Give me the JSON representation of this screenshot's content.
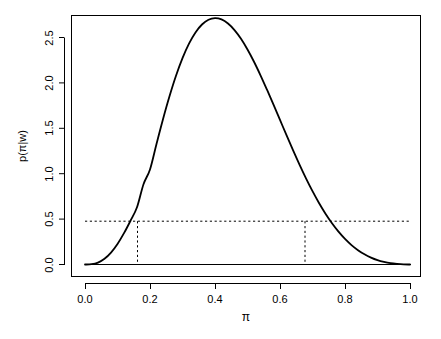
{
  "chart_data": {
    "type": "line",
    "title": "",
    "subtitle": "",
    "xlabel": "π",
    "ylabel": "p(π|w)",
    "xlim": [
      0.0,
      1.0
    ],
    "ylim": [
      0.0,
      2.75
    ],
    "grid": false,
    "legend": null,
    "x_ticks": [
      "0.0",
      "0.2",
      "0.4",
      "0.6",
      "0.8",
      "1.0"
    ],
    "x_tick_values": [
      0.0,
      0.2,
      0.4,
      0.6,
      0.8,
      1.0
    ],
    "y_ticks": [
      "0.0",
      "0.5",
      "1.0",
      "1.5",
      "2.0",
      "2.5"
    ],
    "y_tick_values": [
      0.0,
      0.5,
      1.0,
      1.5,
      2.0,
      2.5
    ],
    "series": [
      {
        "name": "posterior density",
        "style": "solid",
        "color": "#000000",
        "x": [
          0.0,
          0.02,
          0.04,
          0.06,
          0.08,
          0.1,
          0.12,
          0.14,
          0.16,
          0.18,
          0.2,
          0.22,
          0.24,
          0.26,
          0.28,
          0.3,
          0.32,
          0.34,
          0.36,
          0.38,
          0.4,
          0.42,
          0.44,
          0.46,
          0.48,
          0.5,
          0.52,
          0.54,
          0.56,
          0.58,
          0.6,
          0.62,
          0.64,
          0.66,
          0.68,
          0.7,
          0.72,
          0.74,
          0.76,
          0.78,
          0.8,
          0.82,
          0.84,
          0.86,
          0.88,
          0.9,
          0.92,
          0.94,
          0.96,
          0.98,
          1.0
        ],
        "y": [
          0.0,
          0.003,
          0.021,
          0.063,
          0.131,
          0.226,
          0.345,
          0.482,
          0.63,
          0.884,
          1.047,
          1.328,
          1.6,
          1.852,
          2.078,
          2.272,
          2.432,
          2.556,
          2.643,
          2.695,
          2.713,
          2.699,
          2.654,
          2.582,
          2.486,
          2.368,
          2.233,
          2.084,
          1.925,
          1.76,
          1.592,
          1.424,
          1.259,
          1.1,
          0.949,
          0.808,
          0.678,
          0.56,
          0.455,
          0.362,
          0.282,
          0.214,
          0.158,
          0.112,
          0.076,
          0.048,
          0.028,
          0.014,
          0.006,
          0.001,
          0.0
        ]
      }
    ],
    "reference_lines": [
      {
        "name": "horizontal-threshold",
        "orientation": "horizontal",
        "value": 0.5,
        "style": "dashed",
        "color": "#000000",
        "x_from": 0.0,
        "x_to": 1.0
      },
      {
        "name": "lower-bound",
        "orientation": "vertical",
        "value": 0.16,
        "style": "dashed",
        "color": "#000000",
        "y_from": 0.0,
        "y_to": 0.5
      },
      {
        "name": "upper-bound",
        "orientation": "vertical",
        "value": 0.677,
        "style": "dashed",
        "color": "#000000",
        "y_from": 0.0,
        "y_to": 0.5
      }
    ],
    "baseline": {
      "name": "zero-line",
      "orientation": "horizontal",
      "value": 0.0,
      "style": "solid",
      "color": "#000000"
    }
  }
}
